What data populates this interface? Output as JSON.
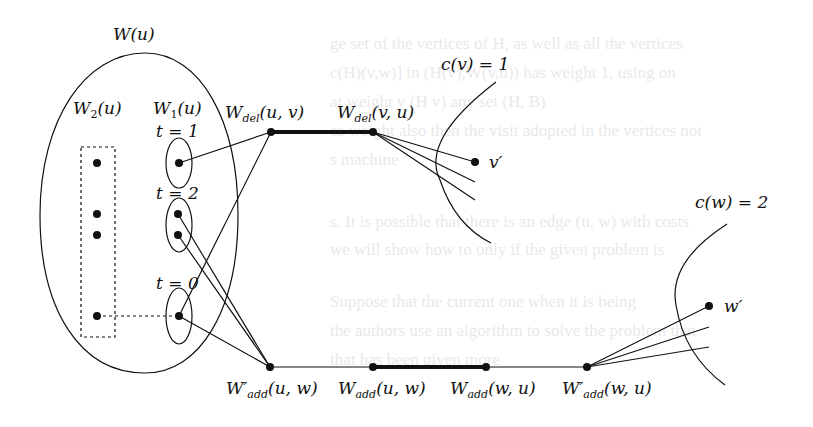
{
  "figure": {
    "type": "graph-construction-diagram",
    "groups": {
      "W_u": {
        "label": "W(u)"
      },
      "W2_u": {
        "label": "W",
        "sub": "2",
        "tail": "(u)"
      },
      "W1_u": {
        "label": "W",
        "sub": "1",
        "tail": "(u)"
      }
    },
    "time_labels": [
      {
        "text": "t = 1"
      },
      {
        "text": "t = 2"
      },
      {
        "text": "t = 0"
      }
    ],
    "nodes": {
      "Wdel_uv": {
        "base": "W",
        "sub": "del",
        "tail": "(u, v)"
      },
      "Wdel_vu": {
        "base": "W",
        "sub": "del",
        "tail": "(v, u)"
      },
      "Wpadd_uw": {
        "base": "W′",
        "sub": "add",
        "tail": "(u, w)"
      },
      "Wadd_uw": {
        "base": "W",
        "sub": "add",
        "tail": "(u, w)"
      },
      "Wadd_wu": {
        "base": "W",
        "sub": "add",
        "tail": "(w, u)"
      },
      "Wpadd_wu": {
        "base": "W′",
        "sub": "add",
        "tail": "(w, u)"
      },
      "v_prime": {
        "label": "v′"
      },
      "w_prime": {
        "label": "w′"
      }
    },
    "clusters": {
      "c_v": {
        "label": "c(v) = 1"
      },
      "c_w": {
        "label": "c(w) = 2"
      }
    },
    "colors": {
      "ink": "#111111",
      "background": "#ffffff",
      "bleed_through": "#e9e9e9"
    }
  },
  "background_text": [
    "ge set of the vertices of H, as well as all the vertices",
    "c(H)(v,w)] in (H(v),W(v,u)) has weight 1, using on",
    "at weight v (H v) any set (H, B)",
    "as weight also then the visit adopted in the vertices not",
    "s machine",
    "s. It is possible that there is an edge (u, w) with costs",
    "we will show how to only if the given problem is",
    "Suppose that the current one when it is being",
    "the authors use an algorithm to solve the problem that",
    "that has been given more"
  ]
}
